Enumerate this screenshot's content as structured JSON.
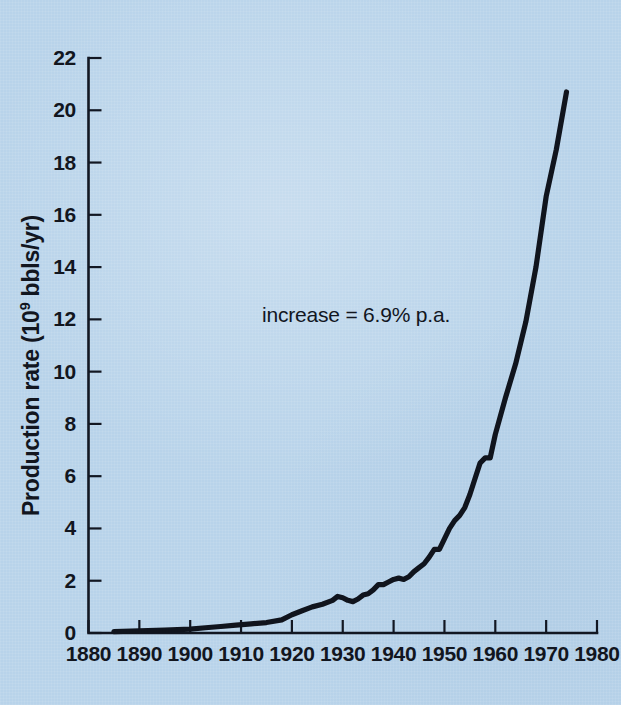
{
  "chart_data": {
    "type": "line",
    "title": "",
    "subtitle": "",
    "xlabel": "",
    "ylabel": "Production rate (10⁹ bbls/yr)",
    "ylabel_base": "Production rate (10",
    "ylabel_exponent": "9",
    "ylabel_tail": " bbls/yr)",
    "xlim": [
      1880,
      1980
    ],
    "ylim": [
      0,
      22
    ],
    "grid": false,
    "legend": null,
    "annotations": [
      {
        "text": "increase = 6.9% p.a.",
        "x": 1910,
        "y": 11.6
      }
    ],
    "xticks": [
      1880,
      1890,
      1900,
      1910,
      1920,
      1930,
      1940,
      1950,
      1960,
      1970,
      1980
    ],
    "xtick_labels": [
      "1880",
      "1890",
      "1900",
      "1910",
      "1920",
      "1930",
      "1940",
      "1950",
      "1960",
      "1970",
      "1980"
    ],
    "yticks": [
      0,
      2,
      4,
      6,
      8,
      10,
      12,
      14,
      16,
      18,
      20,
      22
    ],
    "ytick_labels": [
      "0",
      "2",
      "4",
      "6",
      "8",
      "10",
      "12",
      "14",
      "16",
      "18",
      "20",
      "22"
    ],
    "series": [
      {
        "name": "World crude oil production",
        "x": [
          1885,
          1890,
          1895,
          1900,
          1903,
          1906,
          1909,
          1912,
          1915,
          1918,
          1920,
          1922,
          1924,
          1926,
          1928,
          1929,
          1930,
          1931,
          1932,
          1933,
          1934,
          1935,
          1936,
          1937,
          1938,
          1939,
          1940,
          1941,
          1942,
          1943,
          1944,
          1945,
          1946,
          1947,
          1948,
          1949,
          1950,
          1951,
          1952,
          1953,
          1954,
          1955,
          1956,
          1957,
          1958,
          1959,
          1960,
          1962,
          1964,
          1966,
          1968,
          1970,
          1972,
          1974
        ],
        "y": [
          0.05,
          0.08,
          0.11,
          0.15,
          0.2,
          0.25,
          0.3,
          0.35,
          0.4,
          0.5,
          0.7,
          0.85,
          1.0,
          1.1,
          1.25,
          1.4,
          1.35,
          1.25,
          1.2,
          1.3,
          1.45,
          1.5,
          1.65,
          1.85,
          1.85,
          1.95,
          2.05,
          2.1,
          2.05,
          2.15,
          2.35,
          2.5,
          2.65,
          2.9,
          3.2,
          3.2,
          3.6,
          4.0,
          4.3,
          4.5,
          4.8,
          5.3,
          5.9,
          6.5,
          6.7,
          6.7,
          7.6,
          9.0,
          10.3,
          11.9,
          14.0,
          16.7,
          18.5,
          20.7
        ]
      }
    ]
  },
  "figure": {
    "background_color": "#b8d3ea",
    "ink_color": "#12161f"
  }
}
